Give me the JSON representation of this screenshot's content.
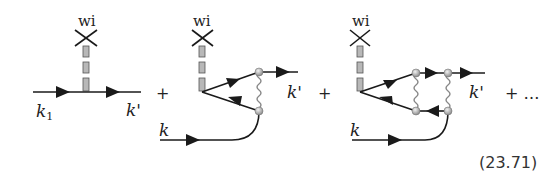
{
  "diagrams": [
    {
      "source_label": "wi",
      "in_label": "k",
      "in_sub": "1",
      "out_label": "k'"
    },
    {
      "source_label": "wi",
      "in_label": "k",
      "out_label": "k'",
      "plus": "+"
    },
    {
      "source_label": "wi",
      "in_label": "k",
      "out_label": "k'",
      "plus": "+"
    }
  ],
  "trailing": "+ …",
  "equation_number": "(23.71)",
  "colors": {
    "line": "#1a1a1a",
    "box_fill": "#b8b8b8",
    "vertex": "#c8c8c8"
  }
}
